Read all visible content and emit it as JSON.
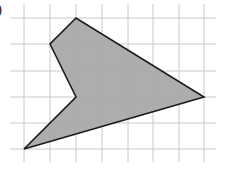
{
  "figure": {
    "label": ")",
    "grid": {
      "columns_x": [
        24,
        50,
        76,
        102,
        128,
        153,
        179,
        204
      ],
      "rows_y": [
        18,
        44,
        71,
        97,
        123,
        149
      ],
      "line_extent": {
        "x_min": 10,
        "x_max": 216,
        "y_min": 4,
        "y_max": 162
      },
      "line_color": "#c8c8c8"
    },
    "polygon": {
      "vertices_grid": [
        [
          2,
          0
        ],
        [
          1,
          1
        ],
        [
          2,
          3
        ],
        [
          0,
          5
        ],
        [
          7,
          3
        ]
      ],
      "fill": "#a9a9a9",
      "stroke": "#1a1a1a"
    }
  }
}
